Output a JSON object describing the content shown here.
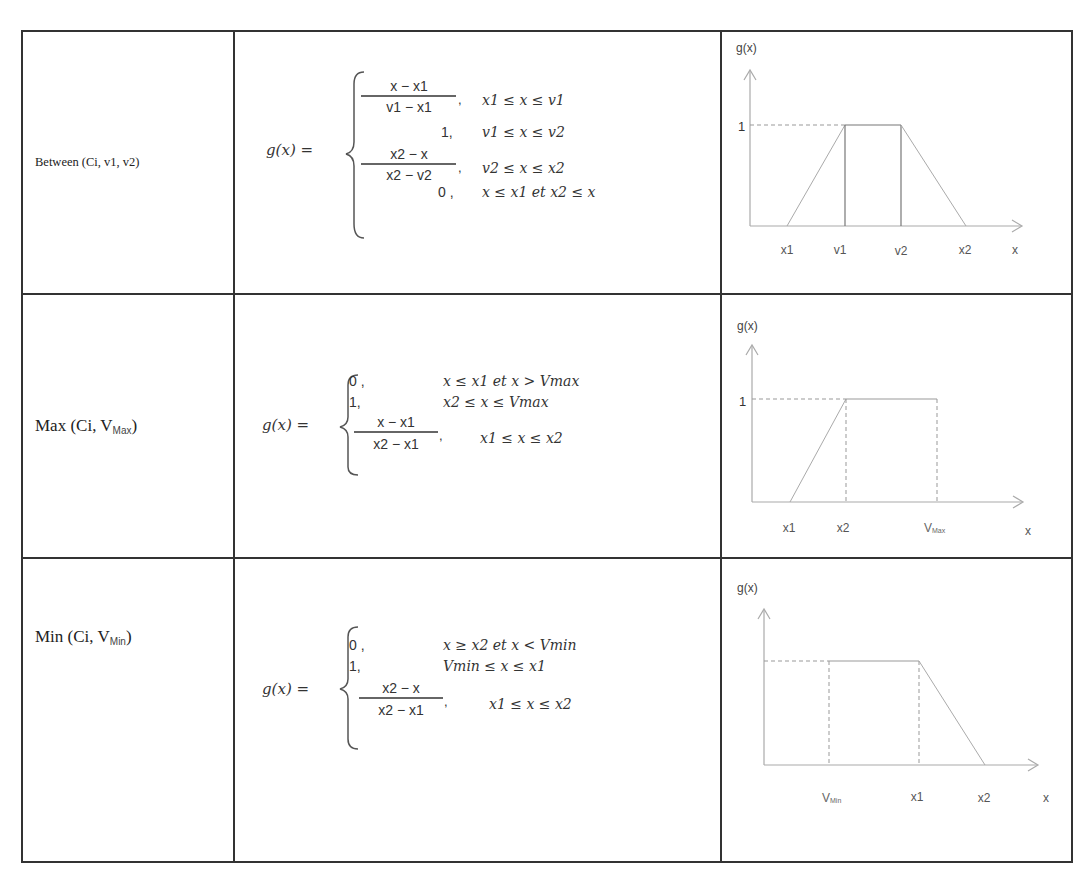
{
  "table": {
    "rows": [
      {
        "name": "Between (Ci, v1, v2)",
        "name_main": "Between (Ci, v1, v2)",
        "formula": {
          "lhs": "g(x) =",
          "cases": [
            {
              "value_num": "x − x1",
              "value_den": "v1 − x1",
              "value": "(x − x1)/(v1 − x1),",
              "condition": "x1 ≤ x ≤ v1"
            },
            {
              "value": "1,",
              "condition": "v1 ≤ x ≤ v2"
            },
            {
              "value_num": "x2 − x",
              "value_den": "x2 − v2",
              "value": "(x2 − x)/(x2 − v2),",
              "condition": "v2 ≤ x ≤ x2"
            },
            {
              "value": "0 ,",
              "condition": "x ≤ x1 et x2 ≤ x"
            }
          ]
        },
        "graph": {
          "y_label": "g(x)",
          "one_label": "1",
          "x_labels": [
            "x1",
            "v1",
            "v2",
            "x2",
            "x"
          ]
        }
      },
      {
        "name_prefix": "Max (Ci, V",
        "name_sub": "Max",
        "name_suffix": ")",
        "formula": {
          "lhs": "g(x) =",
          "cases": [
            {
              "value": "0 ,",
              "condition": "x ≤ x1  et x > Vmax"
            },
            {
              "value": "1,",
              "condition": "x2 ≤ x ≤ Vmax"
            },
            {
              "value_num": "x − x1",
              "value_den": "x2 − x1",
              "value": "(x − x1)/(x2 − x1),",
              "condition": "x1 ≤ x ≤ x2"
            }
          ]
        },
        "graph": {
          "y_label": "g(x)",
          "one_label": "1",
          "x_labels": [
            "x1",
            "x2",
            "V",
            "x"
          ],
          "x_label_sub": "Max"
        }
      },
      {
        "name_prefix": "Min (Ci, V",
        "name_sub": "Min",
        "name_suffix": ")",
        "formula": {
          "lhs": "g(x) =",
          "cases": [
            {
              "value": "0 ,",
              "condition": "x ≥ x2 et x < Vmin"
            },
            {
              "value": "1,",
              "condition": "Vmin ≤ x ≤ x1"
            },
            {
              "value_num": "x2 − x",
              "value_den": "x2 − x1",
              "value": "(x2 − x)/(x2 − x1),",
              "condition": "x1 ≤ x ≤ x2"
            }
          ]
        },
        "graph": {
          "y_label": "g(x)",
          "x_labels": [
            "V",
            "x1",
            "x2",
            "x"
          ],
          "x_label_sub": "Min"
        }
      }
    ]
  }
}
